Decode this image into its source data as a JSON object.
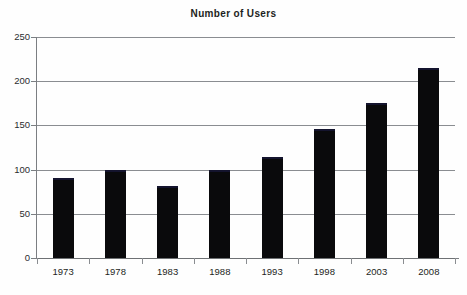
{
  "chart_data": {
    "type": "bar",
    "title": "Number of Users",
    "xlabel": "",
    "ylabel": "",
    "categories": [
      "1973",
      "1978",
      "1983",
      "1988",
      "1993",
      "1998",
      "2003",
      "2008"
    ],
    "values": [
      90,
      100,
      81,
      99,
      114,
      146,
      175,
      215
    ],
    "ylim": [
      0,
      250
    ],
    "yticks": [
      0,
      50,
      100,
      150,
      200,
      250
    ],
    "ytick_labels": [
      "0",
      "50",
      "100",
      "150",
      "200",
      "250"
    ],
    "grid": "horizontal",
    "legend": "none",
    "bar_color": "#0a0a0c",
    "gridline_color": "#8a8d91",
    "axis_color": "#7b7e82",
    "text_color": "#1d1f22",
    "background_color": "#ffffff"
  }
}
